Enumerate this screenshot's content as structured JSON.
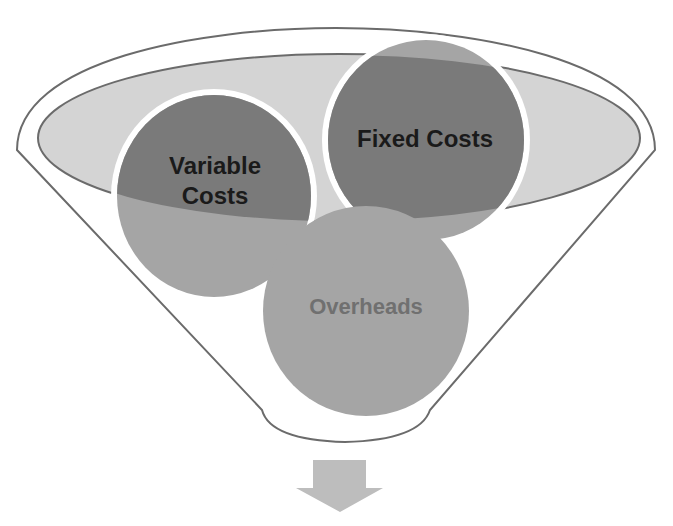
{
  "diagram": {
    "type": "funnel",
    "items": [
      {
        "label_lines": [
          "Variable",
          "Costs"
        ],
        "fill": "#7a7a7a"
      },
      {
        "label_lines": [
          "Fixed Costs"
        ],
        "fill": "#7a7a7a"
      },
      {
        "label_lines": [
          "Overheads"
        ],
        "fill": "#a5a5a5"
      }
    ],
    "colors": {
      "funnel_outline": "#6b6b6b",
      "inner_ellipse_fill": "#d4d4d4",
      "arrow_fill": "#bdbdbd",
      "label_dark": "#1a1a1a",
      "label_muted": "#707070"
    },
    "output_arrow": "down-arrow"
  }
}
